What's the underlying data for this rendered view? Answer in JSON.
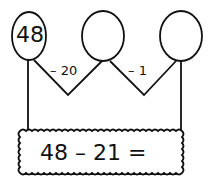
{
  "diagram": {
    "type": "number-bond-subtraction",
    "circles": [
      {
        "label": "48"
      },
      {
        "label": ""
      },
      {
        "label": ""
      }
    ],
    "steps": [
      {
        "label": "– 20"
      },
      {
        "label": "– 1"
      }
    ],
    "equation": "48 – 21 ="
  }
}
